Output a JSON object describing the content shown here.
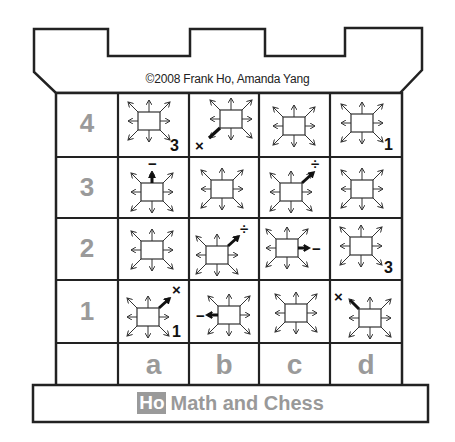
{
  "copyright": "©2008  Frank Ho, Amanda Yang",
  "footer": {
    "badge": "Ho",
    "text": "Math and Chess"
  },
  "ranks": [
    "4",
    "3",
    "2",
    "1"
  ],
  "files": [
    "a",
    "b",
    "c",
    "d"
  ],
  "colors": {
    "line": "#222222",
    "label_gray": "#9a9a9a",
    "text": "#111111"
  },
  "cells": [
    {
      "square": "a4",
      "arrow": "none",
      "operator": "",
      "number": "3"
    },
    {
      "square": "b4",
      "arrow": "down-left",
      "operator": "×",
      "number": ""
    },
    {
      "square": "c4",
      "arrow": "none",
      "operator": "",
      "number": ""
    },
    {
      "square": "d4",
      "arrow": "none",
      "operator": "",
      "number": "1"
    },
    {
      "square": "a3",
      "arrow": "up",
      "operator": "−",
      "number": ""
    },
    {
      "square": "b3",
      "arrow": "none",
      "operator": "",
      "number": ""
    },
    {
      "square": "c3",
      "arrow": "up-right",
      "operator": "÷",
      "number": ""
    },
    {
      "square": "d3",
      "arrow": "none",
      "operator": "",
      "number": ""
    },
    {
      "square": "a2",
      "arrow": "none",
      "operator": "",
      "number": ""
    },
    {
      "square": "b2",
      "arrow": "up-right",
      "operator": "÷",
      "number": ""
    },
    {
      "square": "c2",
      "arrow": "right",
      "operator": "−",
      "number": ""
    },
    {
      "square": "d2",
      "arrow": "none",
      "operator": "",
      "number": "3"
    },
    {
      "square": "a1",
      "arrow": "up-right",
      "operator": "×",
      "number": "1"
    },
    {
      "square": "b1",
      "arrow": "left",
      "operator": "−",
      "number": ""
    },
    {
      "square": "c1",
      "arrow": "none",
      "operator": "",
      "number": ""
    },
    {
      "square": "d1",
      "arrow": "up-left",
      "operator": "×",
      "number": ""
    }
  ],
  "labels": {
    "a4_num": "3",
    "b4_op": "×",
    "d4_num": "1",
    "a3_op": "−",
    "c3_op": "÷",
    "b2_op": "÷",
    "c2_op": "−",
    "d2_num": "3",
    "a1_op": "×",
    "a1_num": "1",
    "b1_op": "−",
    "d1_op": "×"
  }
}
